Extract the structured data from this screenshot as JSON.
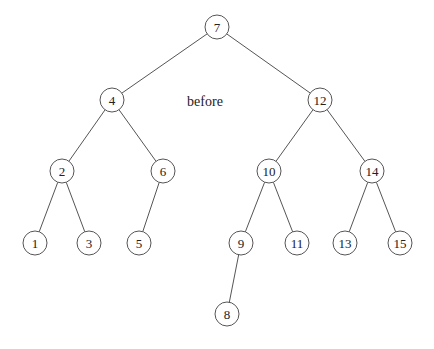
{
  "diagram": {
    "type": "binary-search-tree",
    "caption": "before",
    "caption_pos": [
      205,
      101
    ],
    "node_radius": 12,
    "nodes": [
      {
        "id": "7",
        "label": "7",
        "x": 217,
        "y": 27
      },
      {
        "id": "4",
        "label": "4",
        "x": 112,
        "y": 100
      },
      {
        "id": "12",
        "label": "12",
        "x": 320,
        "y": 100
      },
      {
        "id": "2",
        "label": "2",
        "x": 62,
        "y": 171
      },
      {
        "id": "6",
        "label": "6",
        "x": 163,
        "y": 171
      },
      {
        "id": "10",
        "label": "10",
        "x": 269,
        "y": 171
      },
      {
        "id": "14",
        "label": "14",
        "x": 372,
        "y": 171
      },
      {
        "id": "1",
        "label": "1",
        "x": 35,
        "y": 243
      },
      {
        "id": "3",
        "label": "3",
        "x": 89,
        "y": 243
      },
      {
        "id": "5",
        "label": "5",
        "x": 139,
        "y": 243
      },
      {
        "id": "9",
        "label": "9",
        "x": 241,
        "y": 243
      },
      {
        "id": "11",
        "label": "11",
        "x": 297,
        "y": 243
      },
      {
        "id": "13",
        "label": "13",
        "x": 345,
        "y": 243
      },
      {
        "id": "15",
        "label": "15",
        "x": 400,
        "y": 243
      },
      {
        "id": "8",
        "label": "8",
        "x": 227,
        "y": 314
      }
    ],
    "edges": [
      [
        "7",
        "4"
      ],
      [
        "7",
        "12"
      ],
      [
        "4",
        "2"
      ],
      [
        "4",
        "6"
      ],
      [
        "12",
        "10"
      ],
      [
        "12",
        "14"
      ],
      [
        "2",
        "1"
      ],
      [
        "2",
        "3"
      ],
      [
        "6",
        "5"
      ],
      [
        "10",
        "9"
      ],
      [
        "10",
        "11"
      ],
      [
        "14",
        "13"
      ],
      [
        "14",
        "15"
      ],
      [
        "9",
        "8"
      ]
    ]
  }
}
